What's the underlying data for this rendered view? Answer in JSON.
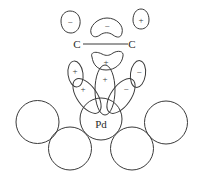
{
  "diagram": {
    "stroke_color": "#3a3a3a",
    "background": "#ffffff",
    "bond": {
      "left_atom": "C",
      "right_atom": "C"
    },
    "metal": {
      "center_label": "Pd"
    },
    "orbital_signs": {
      "top_left": "−",
      "top_center": "−",
      "top_right": "+",
      "pi_lower": "+",
      "d_vertical": "+",
      "left_small": "+",
      "left_tilted": "+",
      "right_small": "−",
      "right_tilted": "−"
    },
    "surface_atoms": [
      {
        "position": "far-left",
        "label": ""
      },
      {
        "position": "left",
        "label": ""
      },
      {
        "position": "center",
        "label": "Pd"
      },
      {
        "position": "right",
        "label": ""
      },
      {
        "position": "far-right",
        "label": ""
      }
    ]
  }
}
